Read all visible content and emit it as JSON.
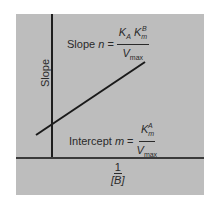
{
  "diagram": {
    "type": "double-reciprocal secondary plot",
    "background_color": "#bdbdbd",
    "y_axis_label": "Slope",
    "x_axis_label": {
      "numerator": "1",
      "denominator": "[B]"
    },
    "slope_equation": {
      "lhs": "Slope",
      "variable": "n",
      "equals": "=",
      "numerator": {
        "K": "K",
        "K_sub": "A",
        "K2": "K",
        "K2_sub": "m",
        "K2_sup": "B"
      },
      "denominator": {
        "V": "V",
        "V_sub": "max"
      }
    },
    "intercept_equation": {
      "lhs": "Intercept",
      "variable": "m",
      "equals": "=",
      "numerator": {
        "K": "K",
        "K_sub": "m",
        "K_sup": "A"
      },
      "denominator": {
        "V": "V",
        "V_sub": "max"
      }
    },
    "line": {
      "x1": 36,
      "y1": 135,
      "x2": 145,
      "y2": 62,
      "color": "#1a1a1a"
    }
  }
}
